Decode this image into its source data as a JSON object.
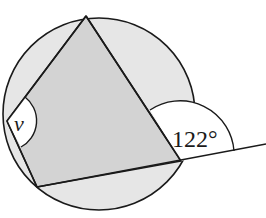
{
  "diagram": {
    "type": "cyclic-quadrilateral",
    "labels": {
      "interior_angle": "v",
      "exterior_angle": "122°"
    },
    "colors": {
      "circle_fill": "#e6e6e6",
      "quad_fill": "#d3d3d3",
      "angle_marker_fill": "#ffffff",
      "stroke": "#1a1a1a"
    }
  }
}
